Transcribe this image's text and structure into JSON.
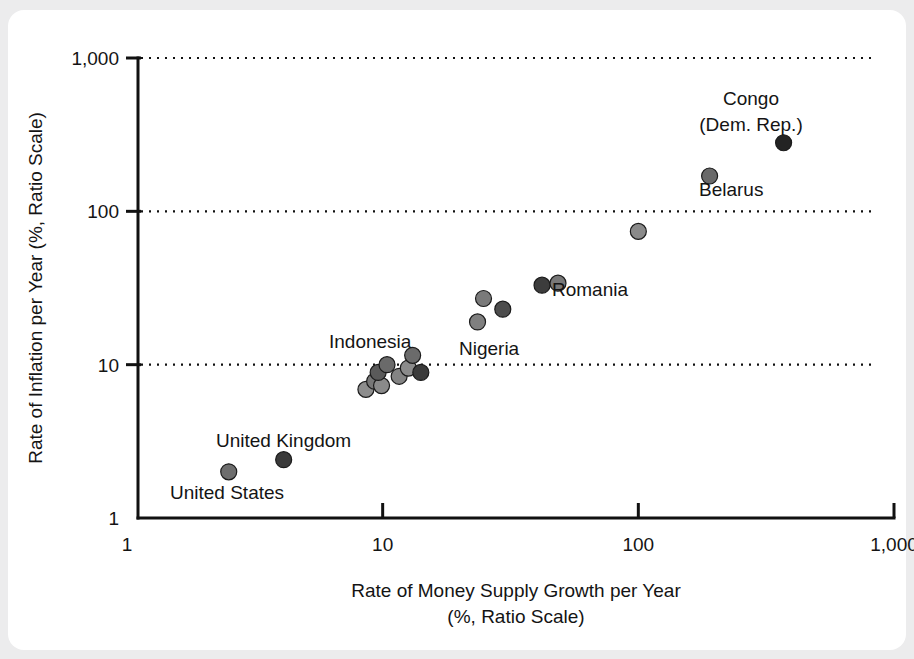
{
  "figure": {
    "background_color": "#ececed",
    "card_color": "#ffffff",
    "axis_color": "#111111",
    "text_color": "#141414"
  },
  "chart_data": {
    "type": "scatter",
    "title": "",
    "xlabel": "Rate of Money Supply Growth per Year",
    "xlabel_line2": "(%, Ratio Scale)",
    "ylabel": "Rate of Inflation per Year (%, Ratio Scale)",
    "xscale": "log",
    "yscale": "log",
    "xlim": [
      1,
      1000
    ],
    "ylim": [
      1,
      1000
    ],
    "xticks": [
      1,
      10,
      100,
      1000
    ],
    "xtick_labels": [
      "1",
      "10",
      "100",
      "1,000"
    ],
    "yticks": [
      1,
      10,
      100,
      1000
    ],
    "ytick_labels": [
      "1",
      "10",
      "100",
      "1,000"
    ],
    "grid": "horizontal-dotted",
    "legend": "none",
    "points": [
      {
        "label": "United States",
        "x": 2.5,
        "y": 2.0,
        "color": "#6e6e6e"
      },
      {
        "label": "United Kingdom",
        "x": 4.1,
        "y": 2.4,
        "color": "#3a3a3a"
      },
      {
        "label": "",
        "x": 8.6,
        "y": 6.9,
        "color": "#8d8d8d"
      },
      {
        "label": "",
        "x": 9.3,
        "y": 7.8,
        "color": "#777777"
      },
      {
        "label": "",
        "x": 9.9,
        "y": 7.3,
        "color": "#8a8a8a"
      },
      {
        "label": "Indonesia",
        "x": 9.6,
        "y": 8.9,
        "color": "#5a5a5a"
      },
      {
        "label": "",
        "x": 10.4,
        "y": 10.0,
        "color": "#6a6a6a"
      },
      {
        "label": "",
        "x": 11.6,
        "y": 8.4,
        "color": "#848484"
      },
      {
        "label": "",
        "x": 12.6,
        "y": 9.5,
        "color": "#8b8b8b"
      },
      {
        "label": "",
        "x": 13.1,
        "y": 11.5,
        "color": "#6b6b6b"
      },
      {
        "label": "",
        "x": 14.1,
        "y": 8.9,
        "color": "#3b3b3b"
      },
      {
        "label": "Nigeria",
        "x": 23.5,
        "y": 19.0,
        "color": "#808080"
      },
      {
        "label": "",
        "x": 24.8,
        "y": 27.0,
        "color": "#7a7a7a"
      },
      {
        "label": "",
        "x": 29.5,
        "y": 23.0,
        "color": "#4d4d4d"
      },
      {
        "label": "",
        "x": 42.0,
        "y": 33.0,
        "color": "#3c3c3c"
      },
      {
        "label": "Romania",
        "x": 48.5,
        "y": 34.0,
        "color": "#787878"
      },
      {
        "label": "",
        "x": 100.0,
        "y": 74.0,
        "color": "#8a8a8a"
      },
      {
        "label": "Belarus",
        "x": 190.0,
        "y": 170.0,
        "color": "#6a6a6a"
      },
      {
        "label": "Congo (Dem. Rep.)",
        "x": 370.0,
        "y": 280.0,
        "color": "#232323"
      }
    ],
    "annotations": [
      {
        "name": "congo-label",
        "text": "Congo",
        "text2": "(Dem. Rep.)",
        "x": 751,
        "y": 105,
        "anchor": "middle"
      },
      {
        "name": "belarus-label",
        "text": "Belarus",
        "x": 699,
        "y": 196,
        "anchor": "start"
      },
      {
        "name": "romania-label",
        "text": "Romania",
        "x": 552,
        "y": 296,
        "anchor": "start"
      },
      {
        "name": "nigeria-label",
        "text": "Nigeria",
        "x": 459,
        "y": 355,
        "anchor": "start"
      },
      {
        "name": "indonesia-label",
        "text": "Indonesia",
        "x": 329,
        "y": 348,
        "anchor": "start"
      },
      {
        "name": "united-kingdom-label",
        "text": "United Kingdom",
        "x": 216,
        "y": 447,
        "anchor": "start"
      },
      {
        "name": "united-states-label",
        "text": "United States",
        "x": 170,
        "y": 499,
        "anchor": "start"
      }
    ]
  }
}
